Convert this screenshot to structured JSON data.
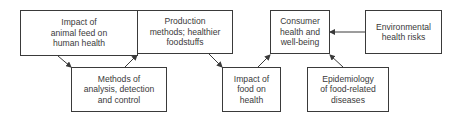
{
  "diagram": {
    "nodes": [
      {
        "id": "animal_feed",
        "label": "Impact of\nanimal feed on\nhuman health"
      },
      {
        "id": "methods_analysis",
        "label": "Methods of\nanalysis, detection\nand control"
      },
      {
        "id": "production",
        "label": "Production\nmethods; healthier\nfoodstuffs"
      },
      {
        "id": "impact_food",
        "label": "Impact of\nfood on\nhealth"
      },
      {
        "id": "consumer_health",
        "label": "Consumer\nhealth and\nwell-being"
      },
      {
        "id": "env_risks",
        "label": "Environmental\nhealth risks"
      },
      {
        "id": "epidemiology",
        "label": "Epidemiology\nof food-related\ndiseases"
      }
    ],
    "edges": [
      {
        "from": "animal_feed",
        "to": "methods_analysis"
      },
      {
        "from": "methods_analysis",
        "to": "production"
      },
      {
        "from": "production",
        "to": "impact_food"
      },
      {
        "from": "impact_food",
        "to": "consumer_health"
      },
      {
        "from": "env_risks",
        "to": "consumer_health"
      },
      {
        "from": "epidemiology",
        "to": "consumer_health"
      }
    ],
    "colors": {
      "stroke": "#3a3a3a",
      "background": "#ffffff",
      "text": "#3a3a3a"
    }
  }
}
